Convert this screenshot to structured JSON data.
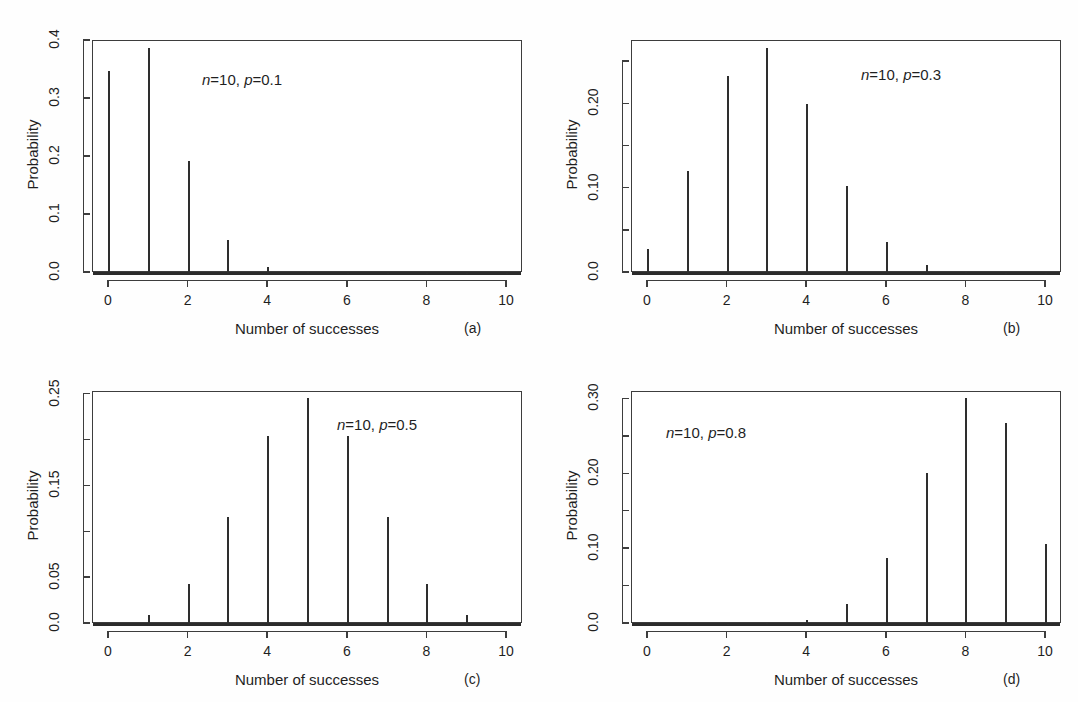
{
  "figure": {
    "panel_count": 4,
    "shared_xlabel": "Number of successes",
    "shared_ylabel": "Probability",
    "ink_color": "#2e2e2e",
    "axis_color": "#3d3d3d",
    "background": "#ffffff"
  },
  "chart_data": [
    {
      "type": "bar",
      "panel_letter": "(a)",
      "annotation": "n=10, p=0.1",
      "annotation_parts": {
        "n_label": "n",
        "n_value": "=10, ",
        "p_label": "p",
        "p_value": "=0.1"
      },
      "title": "",
      "xlabel": "Number of successes",
      "ylabel": "Probability",
      "categories": [
        0,
        1,
        2,
        3,
        4,
        5,
        6,
        7,
        8,
        9,
        10
      ],
      "values": [
        0.3487,
        0.3874,
        0.1937,
        0.0574,
        0.0112,
        0.0015,
        0.0001,
        0.0,
        0.0,
        0.0,
        0.0
      ],
      "xlim": [
        -0.4,
        10.4
      ],
      "ylim": [
        0.0,
        0.4
      ],
      "xticks": [
        0,
        2,
        4,
        6,
        8,
        10
      ],
      "xticklabels": [
        "0",
        "2",
        "4",
        "6",
        "8",
        "10"
      ],
      "yticks": [
        0.0,
        0.1,
        0.2,
        0.3,
        0.4
      ],
      "yticklabels": [
        "0.0",
        "0.1",
        "0.2",
        "0.3",
        "0.4"
      ],
      "grid": false,
      "legend": false
    },
    {
      "type": "bar",
      "panel_letter": "(b)",
      "annotation": "n=10, p=0.3",
      "annotation_parts": {
        "n_label": "n",
        "n_value": "=10, ",
        "p_label": "p",
        "p_value": "=0.3"
      },
      "title": "",
      "xlabel": "Number of successes",
      "ylabel": "Probability",
      "categories": [
        0,
        1,
        2,
        3,
        4,
        5,
        6,
        7,
        8,
        9,
        10
      ],
      "values": [
        0.0282,
        0.1211,
        0.2335,
        0.2668,
        0.2001,
        0.1029,
        0.0368,
        0.009,
        0.0014,
        0.0001,
        0.0
      ],
      "xlim": [
        -0.4,
        10.4
      ],
      "ylim": [
        0.0,
        0.275
      ],
      "xticks": [
        0,
        2,
        4,
        6,
        8,
        10
      ],
      "xticklabels": [
        "0",
        "2",
        "4",
        "6",
        "8",
        "10"
      ],
      "yticks": [
        0.0,
        0.05,
        0.1,
        0.15,
        0.2,
        0.25
      ],
      "yticklabels": [
        "0.0",
        "",
        "0.10",
        "",
        "0.20",
        ""
      ],
      "grid": false,
      "legend": false
    },
    {
      "type": "bar",
      "panel_letter": "(c)",
      "annotation": "n=10, p=0.5",
      "annotation_parts": {
        "n_label": "n",
        "n_value": "=10, ",
        "p_label": "p",
        "p_value": "=0.5"
      },
      "title": "",
      "xlabel": "Number of successes",
      "ylabel": "Probability",
      "categories": [
        0,
        1,
        2,
        3,
        4,
        5,
        6,
        7,
        8,
        9,
        10
      ],
      "values": [
        0.001,
        0.0098,
        0.0439,
        0.1172,
        0.2051,
        0.2461,
        0.2051,
        0.1172,
        0.0439,
        0.0098,
        0.001
      ],
      "xlim": [
        -0.4,
        10.4
      ],
      "ylim": [
        0.0,
        0.253
      ],
      "xticks": [
        0,
        2,
        4,
        6,
        8,
        10
      ],
      "xticklabels": [
        "0",
        "2",
        "4",
        "6",
        "8",
        "10"
      ],
      "yticks": [
        0.0,
        0.05,
        0.1,
        0.15,
        0.2,
        0.25
      ],
      "yticklabels": [
        "0.0",
        "0.05",
        "",
        "0.15",
        "",
        "0.25"
      ],
      "grid": false,
      "legend": false
    },
    {
      "type": "bar",
      "panel_letter": "(d)",
      "annotation": "n=10, p=0.8",
      "annotation_parts": {
        "n_label": "n",
        "n_value": "=10, ",
        "p_label": "p",
        "p_value": "=0.8"
      },
      "title": "",
      "xlabel": "Number of successes",
      "ylabel": "Probability",
      "categories": [
        0,
        1,
        2,
        3,
        4,
        5,
        6,
        7,
        8,
        9,
        10
      ],
      "values": [
        0.0,
        0.0,
        0.0,
        0.0008,
        0.0055,
        0.0264,
        0.0881,
        0.2013,
        0.302,
        0.2684,
        0.1074
      ],
      "xlim": [
        -0.4,
        10.4
      ],
      "ylim": [
        0.0,
        0.31
      ],
      "xticks": [
        0,
        2,
        4,
        6,
        8,
        10
      ],
      "xticklabels": [
        "0",
        "2",
        "4",
        "6",
        "8",
        "10"
      ],
      "yticks": [
        0.0,
        0.05,
        0.1,
        0.15,
        0.2,
        0.25,
        0.3
      ],
      "yticklabels": [
        "0.0",
        "",
        "0.10",
        "",
        "0.20",
        "",
        "0.30"
      ],
      "grid": false,
      "legend": false
    }
  ]
}
